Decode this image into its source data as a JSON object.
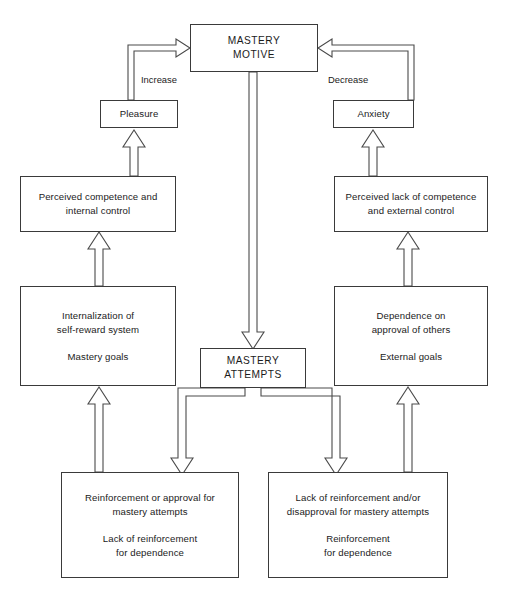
{
  "diagram": {
    "nodes": {
      "mastery_motive": {
        "line1": "MASTERY",
        "line2": "MOTIVE"
      },
      "pleasure": {
        "line1": "Pleasure"
      },
      "anxiety": {
        "line1": "Anxiety"
      },
      "perceived_competence": {
        "line1": "Perceived competence and",
        "line2": "internal control"
      },
      "perceived_lack_competence": {
        "line1": "Perceived lack of competence",
        "line2": "and external control"
      },
      "internalization": {
        "line1": "Internalization of",
        "line2": "self-reward system",
        "line3": "Mastery goals"
      },
      "dependence": {
        "line1": "Dependence on",
        "line2": "approval of others",
        "line3": "External goals"
      },
      "mastery_attempts": {
        "line1": "MASTERY",
        "line2": "ATTEMPTS"
      },
      "reinforcement_positive": {
        "line1": "Reinforcement or approval for",
        "line2": "mastery attempts",
        "line3": "Lack of reinforcement",
        "line4": "for dependence"
      },
      "reinforcement_negative": {
        "line1": "Lack of reinforcement and/or",
        "line2": "disapproval for mastery attempts",
        "line3": "Reinforcement",
        "line4": "for dependence"
      }
    },
    "edge_labels": {
      "increase": "Increase",
      "decrease": "Decrease"
    },
    "colors": {
      "stroke": "#4a4a4a",
      "box_border": "#3a3a3a",
      "text": "#1b1b1b",
      "background": "#ffffff"
    }
  }
}
